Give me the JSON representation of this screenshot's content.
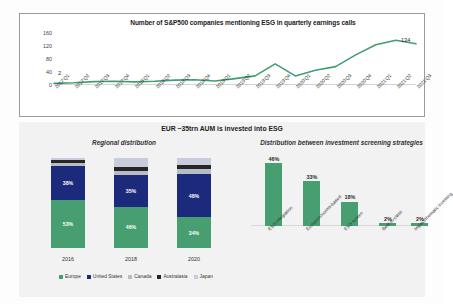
{
  "colors": {
    "green": "#479e70",
    "navy": "#1b2a7a",
    "canada_gray": "#b9bcc4",
    "australasia_black": "#262626",
    "japan_lavender": "#c9ccdf",
    "line": "#3f9e72",
    "panel_bg": "#f2f2f3"
  },
  "line_chart": {
    "title": "Number of S&P500 companies mentioning ESG in quarterly earnings calls",
    "first_label": "2",
    "last_label": "134",
    "chart_data": {
      "type": "line",
      "title": "Number of S&P500 companies mentioning ESG in quarterly earnings calls",
      "xlabel": "",
      "ylabel": "",
      "ylim": [
        0,
        180
      ],
      "yticks": [
        0,
        40,
        80,
        120,
        160
      ],
      "grid": false,
      "legend": "none",
      "categories": [
        "2017'Q1",
        "2017'Q2",
        "2017'Q3",
        "2017'Q4",
        "2018'Q1",
        "2018'Q2",
        "2018'Q3",
        "2018'Q4",
        "2019'Q1",
        "2019'Q2",
        "2019'Q3",
        "2019'Q4",
        "2020'Q1",
        "2020'Q2",
        "2020'Q3",
        "2020'Q4",
        "2021'Q1",
        "2021'Q2",
        "2021'Q3"
      ],
      "values": [
        2,
        4,
        8,
        9,
        7,
        9,
        13,
        14,
        10,
        18,
        27,
        67,
        27,
        46,
        58,
        97,
        131,
        146,
        134
      ],
      "annotations": [
        {
          "label": "2",
          "index": 0
        },
        {
          "label": "134",
          "index": 18
        }
      ]
    }
  },
  "bottom": {
    "title": "EUR ~35trn AUM is invested into ESG",
    "left_subtitle": "Regional distribution",
    "right_subtitle": "Distribution between investment screening strategies",
    "legend": [
      {
        "label": "Europe",
        "color": "#479e70"
      },
      {
        "label": "United States",
        "color": "#1b2a7a"
      },
      {
        "label": "Canada",
        "color": "#b9bcc4"
      },
      {
        "label": "Australasia",
        "color": "#262626"
      },
      {
        "label": "Japan",
        "color": "#c9ccdf"
      }
    ],
    "regional_chart_data": {
      "type": "bar",
      "title": "Regional distribution",
      "stacked": true,
      "xlabel": "",
      "ylabel": "",
      "ylim": [
        0,
        100
      ],
      "categories": [
        "2016",
        "2018",
        "2020"
      ],
      "series": [
        {
          "name": "Europe",
          "color": "#479e70",
          "values": [
            53,
            46,
            34
          ],
          "labels": [
            "53%",
            "46%",
            "34%"
          ]
        },
        {
          "name": "United States",
          "color": "#1b2a7a",
          "values": [
            38,
            35,
            48
          ],
          "labels": [
            "38%",
            "35%",
            "48%"
          ]
        },
        {
          "name": "Canada",
          "color": "#b9bcc4",
          "values": [
            4,
            5,
            6
          ],
          "labels": [
            "",
            "",
            ""
          ]
        },
        {
          "name": "Australasia",
          "color": "#262626",
          "values": [
            3,
            4,
            4
          ],
          "labels": [
            "",
            "",
            ""
          ]
        },
        {
          "name": "Japan",
          "color": "#c9ccdf",
          "values": [
            2,
            10,
            8
          ],
          "labels": [
            "",
            "",
            ""
          ]
        }
      ]
    },
    "strategies_chart_data": {
      "type": "bar",
      "title": "Distribution between investment screening strategies",
      "xlabel": "",
      "ylabel": "",
      "ylim": [
        0,
        50
      ],
      "grid": false,
      "categories": [
        "ESG integration",
        "Exclusion/norms-based",
        "ESG screen",
        "Best-in-class",
        "Impact/thematic investing"
      ],
      "values": [
        46,
        33,
        18,
        2,
        2
      ],
      "labels": [
        "46%",
        "33%",
        "18%",
        "2%",
        "2%"
      ]
    }
  }
}
